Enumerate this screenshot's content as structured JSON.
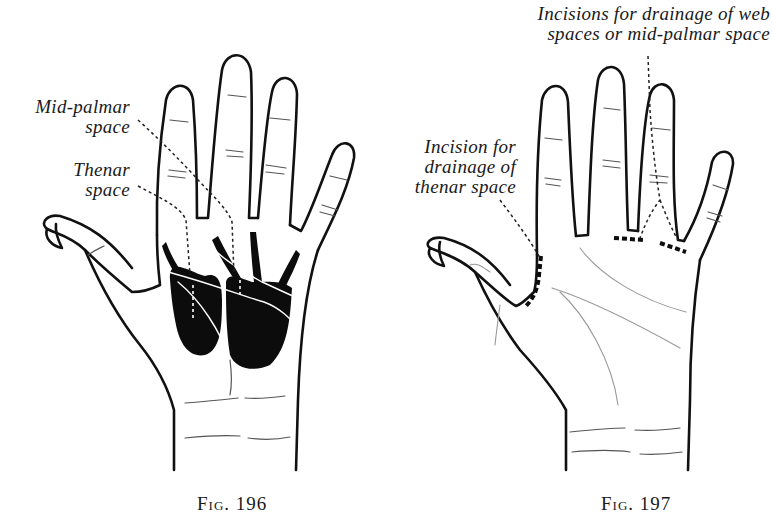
{
  "figures": [
    {
      "id": "fig196",
      "caption": "Fig. 196",
      "labels": {
        "mid_palmar_line1": "Mid-palmar",
        "mid_palmar_line2": "space",
        "thenar_line1": "Thenar",
        "thenar_line2": "space"
      },
      "description": "Palm of left hand showing mid-palmar and thenar fascial spaces shaded black"
    },
    {
      "id": "fig197",
      "caption": "Fig. 197",
      "labels": {
        "web_line1": "Incisions for drainage of web",
        "web_line2": "spaces or mid-palmar space",
        "thenar_line1": "Incision for",
        "thenar_line2": "drainage of",
        "thenar_line3": "thenar space"
      },
      "description": "Palm of left hand showing incision sites (thick dashed lines)"
    }
  ],
  "colors": {
    "ink": "#111111",
    "background": "#ffffff",
    "space_fill": "#0c0c0c"
  }
}
